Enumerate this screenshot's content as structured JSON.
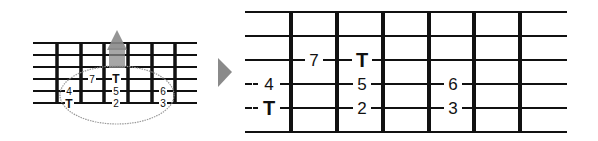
{
  "small_diagram": {
    "strings_y": [
      43,
      55,
      67,
      79,
      91,
      103
    ],
    "x_start": 33,
    "x_end": 197,
    "frets_x": [
      57,
      81,
      104,
      128,
      152,
      175
    ],
    "labels": [
      {
        "text": "7",
        "x": 92,
        "y": 79
      },
      {
        "text": "T",
        "x": 116,
        "y": 79,
        "bold": true
      },
      {
        "text": "4",
        "x": 69,
        "y": 91
      },
      {
        "text": "5",
        "x": 116,
        "y": 91
      },
      {
        "text": "6",
        "x": 163,
        "y": 91
      },
      {
        "text": "T",
        "x": 69,
        "y": 103,
        "bold": true
      },
      {
        "text": "2",
        "x": 116,
        "y": 103
      },
      {
        "text": "3",
        "x": 163,
        "y": 103
      }
    ]
  },
  "large_diagram": {
    "strings_y": [
      12,
      36,
      60,
      84,
      108,
      132
    ],
    "x_start": 245,
    "x_end": 567,
    "frets_x": [
      291,
      337,
      383,
      429,
      474,
      520
    ],
    "labels": [
      {
        "text": "7",
        "x": 314,
        "y": 60
      },
      {
        "text": "T",
        "x": 362,
        "y": 60,
        "bold": true
      },
      {
        "text": "4",
        "x": 269,
        "y": 84
      },
      {
        "text": "5",
        "x": 362,
        "y": 84
      },
      {
        "text": "6",
        "x": 453,
        "y": 84
      },
      {
        "text": "T",
        "x": 269,
        "y": 108,
        "bold": true
      },
      {
        "text": "2",
        "x": 362,
        "y": 108
      },
      {
        "text": "3",
        "x": 453,
        "y": 108
      }
    ]
  },
  "arrow_color": "#8a8a8a",
  "ellipse_color": "#999999"
}
